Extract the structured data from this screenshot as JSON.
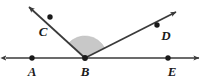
{
  "figure": {
    "width": 205,
    "height": 79,
    "background_color": "#ffffff",
    "stroke_color": "#3a3a3a",
    "point_color": "#1a1a1a",
    "sector_fill_color": "#c8c8c8",
    "sector_stroke_color": "#b4b4b4"
  },
  "labels": {
    "a": "A",
    "b": "B",
    "c": "C",
    "d": "D",
    "e": "E"
  },
  "points": {
    "a": {
      "name": "A",
      "x": 32,
      "y": 58
    },
    "b": {
      "name": "B",
      "x": 85,
      "y": 58
    },
    "c": {
      "name": "C",
      "x": 50,
      "y": 17
    },
    "d": {
      "name": "D",
      "x": 157,
      "y": 25
    },
    "e": {
      "name": "E",
      "x": 168,
      "y": 58
    }
  },
  "label_positions": {
    "a": {
      "x": 32,
      "y": 76
    },
    "b": {
      "x": 85,
      "y": 76
    },
    "c": {
      "x": 43,
      "y": 36
    },
    "d": {
      "x": 166,
      "y": 40
    },
    "e": {
      "x": 172,
      "y": 76
    }
  },
  "line_ae": {
    "name": "line AE",
    "x1": 6,
    "y1": 58,
    "x2": 199,
    "y2": 58,
    "arrows": "both"
  },
  "ray_bc": {
    "name": "ray BC",
    "x1": 85,
    "y1": 58,
    "x2": 29,
    "y2": 7,
    "arrows": "end"
  },
  "ray_bd": {
    "name": "ray BD",
    "x1": 85,
    "y1": 58,
    "x2": 176,
    "y2": 12,
    "arrows": "end"
  },
  "shaded_sector": {
    "name": "angle CBD shaded sector",
    "vertex_x": 85,
    "vertex_y": 58,
    "radius": 22,
    "start_angle_deg": 27,
    "end_angle_deg": 138
  }
}
